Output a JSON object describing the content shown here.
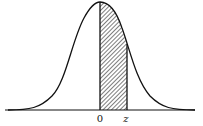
{
  "diagram": {
    "type": "standard-normal-curve",
    "shaded_region": {
      "from": "0",
      "to": "z",
      "pattern": "diagonal-hatch"
    },
    "labels": {
      "origin": "0",
      "z": "z"
    },
    "colors": {
      "stroke": "#111111",
      "background": "#ffffff"
    }
  }
}
